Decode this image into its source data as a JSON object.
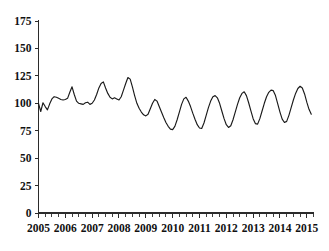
{
  "chart_data": {
    "type": "line",
    "title": "",
    "subtitle": "",
    "xlabel": "",
    "ylabel": "",
    "grid": false,
    "legend": false,
    "legend_position": "none",
    "xlim": [
      2005.0,
      2015.25
    ],
    "ylim": [
      0,
      175
    ],
    "yticks": [
      0,
      25,
      50,
      75,
      100,
      125,
      150,
      175
    ],
    "ytick_labels": [
      "0",
      "25",
      "50",
      "75",
      "100",
      "125",
      "150",
      "175"
    ],
    "xticks": [
      2005,
      2006,
      2007,
      2008,
      2009,
      2010,
      2011,
      2012,
      2013,
      2014,
      2015
    ],
    "xtick_labels": [
      "2005",
      "2006",
      "2007",
      "2008",
      "2009",
      "2010",
      "2011",
      "2012",
      "2013",
      "2014",
      "2015"
    ],
    "minor_tick_interval_years": 0.25,
    "series": [
      {
        "name": "index",
        "color": "#1a1a1a",
        "x": [
          2005.0,
          2005.083,
          2005.167,
          2005.25,
          2005.333,
          2005.417,
          2005.5,
          2005.583,
          2005.667,
          2005.75,
          2005.833,
          2005.917,
          2006.0,
          2006.083,
          2006.167,
          2006.25,
          2006.333,
          2006.417,
          2006.5,
          2006.583,
          2006.667,
          2006.75,
          2006.833,
          2006.917,
          2007.0,
          2007.083,
          2007.167,
          2007.25,
          2007.333,
          2007.417,
          2007.5,
          2007.583,
          2007.667,
          2007.75,
          2007.833,
          2007.917,
          2008.0,
          2008.083,
          2008.167,
          2008.25,
          2008.333,
          2008.417,
          2008.5,
          2008.583,
          2008.667,
          2008.75,
          2008.833,
          2008.917,
          2009.0,
          2009.083,
          2009.167,
          2009.25,
          2009.333,
          2009.417,
          2009.5,
          2009.583,
          2009.667,
          2009.75,
          2009.833,
          2009.917,
          2010.0,
          2010.083,
          2010.167,
          2010.25,
          2010.333,
          2010.417,
          2010.5,
          2010.583,
          2010.667,
          2010.75,
          2010.833,
          2010.917,
          2011.0,
          2011.083,
          2011.167,
          2011.25,
          2011.333,
          2011.417,
          2011.5,
          2011.583,
          2011.667,
          2011.75,
          2011.833,
          2011.917,
          2012.0,
          2012.083,
          2012.167,
          2012.25,
          2012.333,
          2012.417,
          2012.5,
          2012.583,
          2012.667,
          2012.75,
          2012.833,
          2012.917,
          2013.0,
          2013.083,
          2013.167,
          2013.25,
          2013.333,
          2013.417,
          2013.5,
          2013.583,
          2013.667,
          2013.75,
          2013.833,
          2013.917,
          2014.0,
          2014.083,
          2014.167,
          2014.25,
          2014.333,
          2014.417,
          2014.5,
          2014.583,
          2014.667,
          2014.75,
          2014.833,
          2014.917,
          2015.0,
          2015.083,
          2015.167
        ],
        "values": [
          100.0,
          92.5,
          100.5,
          97.0,
          94.0,
          99.5,
          104.0,
          106.0,
          105.5,
          104.5,
          103.5,
          103.0,
          103.5,
          104.5,
          110.0,
          115.0,
          108.0,
          102.0,
          100.0,
          99.5,
          99.0,
          100.5,
          101.0,
          99.0,
          100.0,
          103.0,
          108.0,
          114.0,
          118.0,
          119.5,
          114.0,
          109.0,
          105.5,
          104.0,
          105.0,
          104.0,
          103.0,
          106.0,
          112.0,
          118.0,
          123.5,
          122.0,
          115.0,
          107.0,
          100.0,
          95.5,
          92.0,
          89.5,
          88.5,
          90.0,
          95.0,
          100.0,
          103.5,
          102.0,
          97.0,
          92.0,
          87.0,
          82.5,
          79.0,
          76.5,
          76.0,
          79.0,
          85.0,
          92.0,
          99.0,
          104.0,
          105.5,
          102.0,
          97.0,
          91.0,
          85.5,
          80.5,
          77.5,
          77.0,
          82.0,
          89.0,
          96.0,
          102.0,
          106.0,
          107.0,
          105.0,
          100.0,
          93.0,
          86.0,
          80.5,
          78.0,
          79.5,
          85.0,
          92.0,
          99.0,
          105.0,
          109.0,
          110.5,
          107.0,
          100.5,
          93.0,
          86.0,
          81.5,
          81.0,
          86.0,
          93.0,
          100.0,
          106.0,
          110.0,
          112.0,
          111.5,
          107.0,
          99.5,
          92.0,
          85.5,
          82.5,
          83.5,
          89.0,
          96.0,
          103.0,
          109.0,
          113.5,
          115.5,
          114.0,
          108.5,
          101.0,
          94.5,
          90.0
        ]
      }
    ]
  }
}
